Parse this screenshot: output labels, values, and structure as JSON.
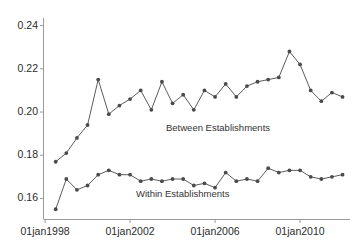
{
  "chart_data": {
    "type": "line",
    "title": "",
    "subtitle": "",
    "xlabel": "",
    "ylabel": "",
    "grid": false,
    "legend_position": "inline-annotations",
    "ylim": [
      0.1505,
      0.2435
    ],
    "yticks": [
      0.16,
      0.18,
      0.2,
      0.22,
      0.24
    ],
    "ytick_labels": [
      "0.16",
      "0.18",
      "0.20",
      "0.22",
      "0.24"
    ],
    "xticks": [
      "01jan1998",
      "01jan2002",
      "01jan2006",
      "01jan2010"
    ],
    "xtick_labels": [
      "01jan1998",
      "01jan2002",
      "01jan2006",
      "01jan2010"
    ],
    "xlim": [
      "01jul1998",
      "01jan2012"
    ],
    "x": [
      "1998.5",
      "1999.0",
      "1999.5",
      "2000.0",
      "2000.5",
      "2001.0",
      "2001.5",
      "2002.0",
      "2002.5",
      "2003.0",
      "2003.5",
      "2004.0",
      "2004.5",
      "2005.0",
      "2005.5",
      "2006.0",
      "2006.5",
      "2007.0",
      "2007.5",
      "2008.0",
      "2008.5",
      "2009.0",
      "2009.5",
      "2010.0",
      "2010.5",
      "2011.0",
      "2011.5",
      "2012.0"
    ],
    "series": [
      {
        "name": "Between Establishments",
        "color": "#4a4a4a",
        "marker": "circle",
        "label_x": "2003.2",
        "label_y": 0.1955,
        "values": [
          0.177,
          0.181,
          0.188,
          0.194,
          0.215,
          0.199,
          0.203,
          0.206,
          0.21,
          0.201,
          0.214,
          0.204,
          0.208,
          0.201,
          0.21,
          0.207,
          0.213,
          0.207,
          0.212,
          0.214,
          0.215,
          0.216,
          0.228,
          0.222,
          0.21,
          0.205,
          0.209,
          0.207
        ]
      },
      {
        "name": "Within Establishments",
        "color": "#4a4a4a",
        "marker": "circle",
        "label_x": "2002.3",
        "label_y": 0.1625,
        "values": [
          0.155,
          0.169,
          0.164,
          0.166,
          0.171,
          0.173,
          0.171,
          0.171,
          0.168,
          0.169,
          0.168,
          0.169,
          0.169,
          0.166,
          0.167,
          0.165,
          0.172,
          0.168,
          0.169,
          0.168,
          0.174,
          0.172,
          0.173,
          0.173,
          0.17,
          0.169,
          0.17,
          0.171
        ]
      }
    ],
    "annotations": [
      {
        "text": "Between Establishments",
        "x_px": 166,
        "y_px": 122
      },
      {
        "text": "Within Establishments",
        "x_px": 136,
        "y_px": 188
      }
    ]
  },
  "axes": {
    "y_axis_name": "y-axis",
    "x_axis_name": "x-axis",
    "axis_color": "#8a8a8a"
  }
}
